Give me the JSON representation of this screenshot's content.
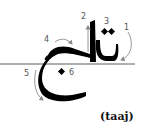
{
  "diagram": {
    "word_arabic": "تاج",
    "transliteration": "(taaj)",
    "stroke_labels": [
      "1",
      "2",
      "3",
      "4",
      "5",
      "6"
    ],
    "colors": {
      "ink": "#000000",
      "arrow": "#8a8a8a",
      "label": "#555555",
      "baseline": "#333333"
    }
  }
}
